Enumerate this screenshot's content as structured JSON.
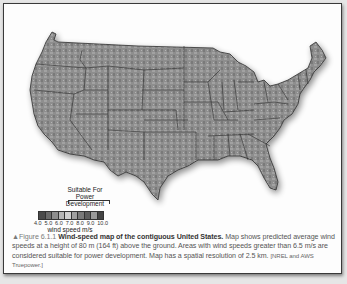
{
  "figure": {
    "marker": "▲",
    "label": "Figure 6.1.1",
    "title": "Wind-speed map of the contiguous United States.",
    "description": "Map shows predicted average wind speeds at a height of 80 m (164 ft) above the ground. Areas with wind speeds greater than 6.5 m/s are considered suitable for power development. Map has a spatial resolution of 2.5 km.",
    "source": "[NREL and AWS Truepower.]"
  },
  "legend": {
    "title_line1": "Suitable For",
    "title_line2": "Power Development",
    "ticks": [
      "4.0",
      "5.0",
      "6.0",
      "7.0",
      "8.0",
      "9.0",
      "10.0"
    ],
    "unit": "wind speed m/s",
    "swatches": [
      "#4a4a4a",
      "#6a6a6a",
      "#8c8c8c",
      "#b5b5b5",
      "#cfcfcf",
      "#a0a0a0",
      "#7a7a7a",
      "#5e5e5e",
      "#9a9a9a",
      "#444444"
    ]
  },
  "colors": {
    "land": "#8e8e8e",
    "border": "#2e2e2e",
    "frame": "#3a3a3a",
    "background": "#fdfdfd"
  }
}
